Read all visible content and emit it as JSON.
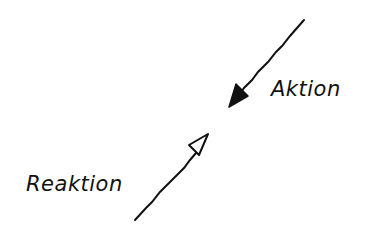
{
  "diagram": {
    "labels": {
      "action": "Aktion",
      "reaction": "Reaktion"
    },
    "arrows": [
      {
        "name": "action-arrow",
        "style": "filled-head",
        "from": [
          304,
          20
        ],
        "to": [
          229,
          107
        ]
      },
      {
        "name": "reaction-arrow",
        "style": "hollow-head",
        "from": [
          135,
          220
        ],
        "to": [
          208,
          134
        ]
      }
    ],
    "colors": {
      "stroke": "#111111",
      "background": "#ffffff"
    }
  }
}
